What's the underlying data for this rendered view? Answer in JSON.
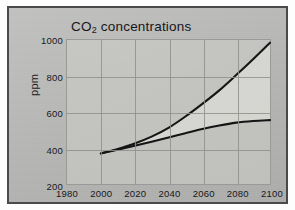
{
  "figure": {
    "title_main": "CO",
    "title_sub": "2",
    "title_rest": " concentrations",
    "title_full": "CO2 concentrations",
    "background_color": "#b9b9b7",
    "frame_color": "#4a4a4a"
  },
  "chart_data": {
    "type": "line",
    "title": "CO2 concentrations",
    "xlabel": "",
    "ylabel": "ppm",
    "xlim": [
      1980,
      2100
    ],
    "ylim": [
      200,
      1000
    ],
    "xticks": [
      1980,
      2000,
      2020,
      2040,
      2060,
      2080,
      2100
    ],
    "yticks": [
      200,
      400,
      600,
      800,
      1000
    ],
    "grid": true,
    "legend": "none",
    "fill_between_series": [
      "High scenario",
      "Low scenario"
    ],
    "fill_color": "#d8d8d4",
    "line_color": "#1a1a1a",
    "x": [
      2000,
      2010,
      2020,
      2030,
      2040,
      2050,
      2060,
      2070,
      2080,
      2090,
      2100
    ],
    "series": [
      {
        "name": "High scenario",
        "values": [
          370,
          395,
          425,
          463,
          512,
          575,
          645,
          720,
          805,
          893,
          985
        ]
      },
      {
        "name": "Low scenario",
        "values": [
          370,
          390,
          412,
          435,
          458,
          482,
          505,
          525,
          541,
          550,
          555
        ]
      }
    ]
  },
  "axes": {
    "y_tick_labels": [
      "1000",
      "800",
      "600",
      "400",
      "200"
    ],
    "x_tick_labels": [
      "1980",
      "2000",
      "2020",
      "2040",
      "2060",
      "2080",
      "2100"
    ],
    "y_axis_title": "ppm"
  }
}
